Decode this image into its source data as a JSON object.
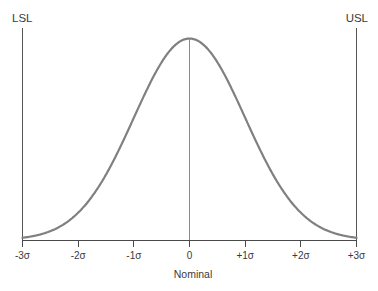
{
  "figure": {
    "name": "process-capability-bell-curve",
    "background_color": "#ffffff"
  },
  "limits": {
    "lower": {
      "label": "LSL",
      "x": -3
    },
    "upper": {
      "label": "USL",
      "x": 3
    }
  },
  "axis": {
    "title": "Nominal",
    "tick_labels": [
      "-3σ",
      "-2σ",
      "-1σ",
      "0",
      "+1σ",
      "+2σ",
      "+3σ"
    ]
  },
  "colors": {
    "curve": "#808080",
    "axis": "#4a4a4a",
    "spec_limit_line": "#555555",
    "center_line": "#8a8a8a",
    "text": "#3a3a3a"
  },
  "chart_data": {
    "type": "line",
    "title": "",
    "subtitle": "",
    "xlabel": "Nominal",
    "ylabel": "",
    "xlim": [
      -3,
      3
    ],
    "ylim": [
      0,
      1
    ],
    "grid": false,
    "legend": "none",
    "x_tick_values": [
      -3,
      -2,
      -1,
      0,
      1,
      2,
      3
    ],
    "x_tick_labels": [
      "-3σ",
      "-2σ",
      "-1σ",
      "0",
      "+1σ",
      "+2σ",
      "+3σ"
    ],
    "series": [
      {
        "name": "Normal distribution",
        "distribution": "normal",
        "mean": 0,
        "sigma": 1,
        "peak_value": 1,
        "x": [
          -3,
          -2.75,
          -2.5,
          -2.25,
          -2,
          -1.75,
          -1.5,
          -1.25,
          -1,
          -0.75,
          -0.5,
          -0.25,
          0,
          0.25,
          0.5,
          0.75,
          1,
          1.25,
          1.5,
          1.75,
          2,
          2.25,
          2.5,
          2.75,
          3
        ],
        "values": [
          0.011,
          0.022,
          0.044,
          0.079,
          0.135,
          0.216,
          0.325,
          0.458,
          0.607,
          0.755,
          0.882,
          0.969,
          1.0,
          0.969,
          0.882,
          0.755,
          0.607,
          0.458,
          0.325,
          0.216,
          0.135,
          0.079,
          0.044,
          0.022,
          0.011
        ]
      }
    ],
    "annotations": [
      {
        "name": "lower-spec-limit",
        "label": "LSL",
        "x": -3,
        "type": "vertical-line"
      },
      {
        "name": "upper-spec-limit",
        "label": "USL",
        "x": 3,
        "type": "vertical-line"
      },
      {
        "name": "nominal-center-line",
        "label": "",
        "x": 0,
        "type": "vertical-line"
      }
    ]
  }
}
